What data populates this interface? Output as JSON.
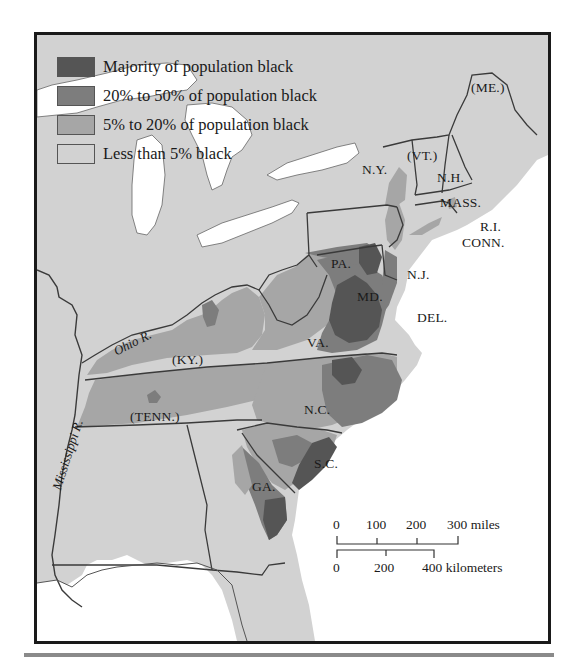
{
  "legend": {
    "items": [
      {
        "label": "Majority of population black",
        "color": "#555555"
      },
      {
        "label": "20% to 50% of population black",
        "color": "#7d7d7d"
      },
      {
        "label": "5% to 20% of population black",
        "color": "#a6a6a6"
      },
      {
        "label": "Less than 5% black",
        "color": "#d2d2d2"
      }
    ]
  },
  "colors": {
    "water": "#ffffff",
    "land_base": "#d2d2d2",
    "border": "#3a3a3a",
    "frame": "#1a1a1a",
    "rule": "#8a8a8a"
  },
  "states": {
    "me": "(ME.)",
    "vt": "(VT.)",
    "nh": "N.H.",
    "ny": "N.Y.",
    "mass": "MASS.",
    "ri": "R.I.",
    "conn": "CONN.",
    "pa": "PA.",
    "nj": "N.J.",
    "md": "MD.",
    "del": "DEL.",
    "va": "VA.",
    "ky": "(KY.)",
    "tenn": "(TENN.)",
    "nc": "N.C.",
    "sc": "S.C.",
    "ga": "GA."
  },
  "rivers": {
    "ohio": "Ohio R.",
    "mississippi": "Mississippi R."
  },
  "scale": {
    "miles_ticks": [
      "0",
      "100",
      "200",
      "300 miles"
    ],
    "km_ticks": [
      "0",
      "200",
      "400 kilometers"
    ]
  }
}
